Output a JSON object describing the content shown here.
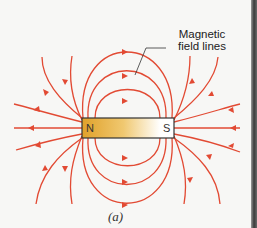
{
  "diagram": {
    "label": {
      "line1": "Magnetic",
      "line2": "field lines"
    },
    "magnet": {
      "north": "N",
      "south": "S",
      "gradient_start": "#e0a12a",
      "gradient_end": "#ffffff"
    },
    "caption": "(a)",
    "line_color": "#e24a33"
  }
}
